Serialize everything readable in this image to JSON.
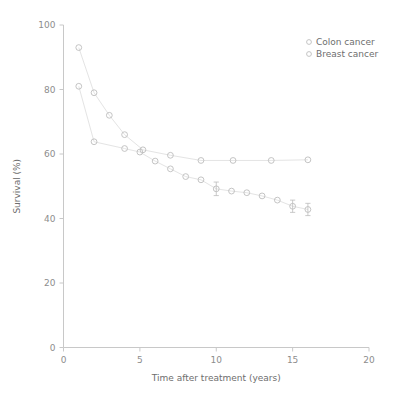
{
  "chart_data": {
    "type": "scatter",
    "title": "",
    "xlabel": "Time after treatment (years)",
    "ylabel": "Survival (%)",
    "xlim": [
      0,
      20
    ],
    "ylim": [
      0,
      100
    ],
    "xticks": [
      0,
      5,
      10,
      15,
      20
    ],
    "yticks": [
      0,
      20,
      40,
      60,
      80,
      100
    ],
    "xtick_labels": [
      "0",
      "5",
      "10",
      "15",
      "20"
    ],
    "ytick_labels": [
      "0",
      "20",
      "40",
      "60",
      "80",
      "100"
    ],
    "grid": false,
    "legend_position": "top-right",
    "marker_style": "open-circle",
    "connecting_lines": true,
    "series": [
      {
        "name": "Colon cancer",
        "color": "#bdbdbd",
        "points": [
          {
            "x": 1.0,
            "y": 93.0,
            "err": 0
          },
          {
            "x": 2.0,
            "y": 79.0,
            "err": 0
          },
          {
            "x": 3.0,
            "y": 72.0,
            "err": 0
          },
          {
            "x": 4.0,
            "y": 66.0,
            "err": 0
          },
          {
            "x": 5.2,
            "y": 61.3,
            "err": 0
          },
          {
            "x": 7.0,
            "y": 59.6,
            "err": 0
          },
          {
            "x": 9.0,
            "y": 58.0,
            "err": 0
          },
          {
            "x": 11.1,
            "y": 58.0,
            "err": 0
          },
          {
            "x": 13.6,
            "y": 58.0,
            "err": 0
          },
          {
            "x": 16.0,
            "y": 58.2,
            "err": 0
          }
        ]
      },
      {
        "name": "Breast cancer",
        "color": "#bdbdbd",
        "points": [
          {
            "x": 1.0,
            "y": 81.0,
            "err": 0
          },
          {
            "x": 2.0,
            "y": 63.8,
            "err": 0
          },
          {
            "x": 4.0,
            "y": 61.7,
            "err": 0
          },
          {
            "x": 5.0,
            "y": 60.6,
            "err": 0
          },
          {
            "x": 6.0,
            "y": 57.8,
            "err": 0
          },
          {
            "x": 7.0,
            "y": 55.4,
            "err": 0
          },
          {
            "x": 8.0,
            "y": 53.0,
            "err": 0
          },
          {
            "x": 9.0,
            "y": 52.0,
            "err": 0
          },
          {
            "x": 10.0,
            "y": 49.2,
            "err": 2.1
          },
          {
            "x": 11.0,
            "y": 48.5,
            "err": 0
          },
          {
            "x": 12.0,
            "y": 48.0,
            "err": 0
          },
          {
            "x": 13.0,
            "y": 47.0,
            "err": 0
          },
          {
            "x": 14.0,
            "y": 45.7,
            "err": 0
          },
          {
            "x": 15.0,
            "y": 43.8,
            "err": 1.9
          },
          {
            "x": 16.0,
            "y": 42.8,
            "err": 1.9
          }
        ]
      }
    ]
  },
  "legend": {
    "entries": [
      {
        "label": "Colon cancer"
      },
      {
        "label": "Breast cancer"
      }
    ]
  }
}
